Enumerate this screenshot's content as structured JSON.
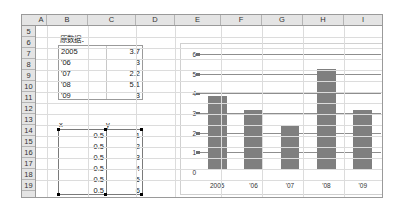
{
  "sheet": {
    "columns": [
      "A",
      "B",
      "C",
      "D",
      "E",
      "F",
      "G",
      "H",
      "I"
    ],
    "rows": [
      "5",
      "6",
      "7",
      "8",
      "9",
      "10",
      "11",
      "12",
      "13",
      "14",
      "15",
      "16",
      "17",
      "18",
      "19"
    ]
  },
  "original_data": {
    "label": "原数据：",
    "years": [
      "2005",
      "'06",
      "'07",
      "'08",
      "'09"
    ],
    "values": [
      "3.7",
      "3",
      "2.2",
      "5.1",
      "3"
    ]
  },
  "xy_table": {
    "header_x": "x",
    "header_y": "y",
    "x_values": [
      "0.5",
      "0.5",
      "0.5",
      "0.5",
      "0.5",
      "0.5"
    ],
    "y_values": [
      "1",
      "2",
      "3",
      "4",
      "5",
      "6"
    ]
  },
  "chart_data": {
    "type": "bar",
    "categories": [
      "2005",
      "'06",
      "'07",
      "'08",
      "'09"
    ],
    "values": [
      3.7,
      3,
      2.2,
      5.1,
      3
    ],
    "title": "",
    "xlabel": "",
    "ylabel": "",
    "ylim": [
      0,
      6
    ],
    "yticks": [
      "0",
      "1",
      "2",
      "3",
      "4",
      "5",
      "6"
    ],
    "grid": true,
    "legend": false,
    "bar_color": "#7f7f7f"
  }
}
